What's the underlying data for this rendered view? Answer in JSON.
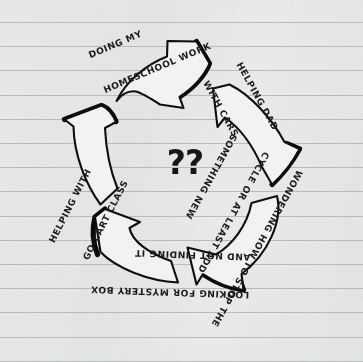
{
  "page": {
    "medium": "lined notebook paper",
    "paper_color": "#e9e9e9",
    "rule_line_color": "#b9bcc0",
    "ink_color": "#141414"
  },
  "diagram": {
    "type": "cycle",
    "direction": "clockwise",
    "node_count": 5,
    "center_label": "??",
    "nodes": [
      {
        "id": "doing-homeschool-work",
        "position": "top",
        "lines": [
          "DOING MY",
          "HOMESCHOOL WORK"
        ],
        "rotation_deg": -23
      },
      {
        "id": "helping-dad-with-cars",
        "position": "upper-right",
        "lines": [
          "HELPING DAD",
          "WITH CARS"
        ],
        "rotation_deg": 61
      },
      {
        "id": "wondering-how-to-stop-the-cycle",
        "position": "lower-right",
        "lines": [
          "WONDERING HOW TO STOP THE",
          "CYCLE OR AT LEAST ADD",
          "SOMETHING NEW"
        ],
        "rotation_deg": 119
      },
      {
        "id": "looking-for-mystery-box",
        "position": "bottom",
        "lines": [
          "LOOKING FOR MYSTERY BOX",
          "AND NOT FINDING IT"
        ],
        "rotation_deg": 182
      },
      {
        "id": "helping-with-go-cart-class",
        "position": "left",
        "lines": [
          "HELPING WITH",
          "GO-CART CLASS"
        ],
        "rotation_deg": -63
      }
    ],
    "arrows": [
      {
        "id": "arrow-top",
        "points_to": "upper-right"
      },
      {
        "id": "arrow-upper-right",
        "points_to": "lower-right"
      },
      {
        "id": "arrow-lower-right",
        "points_to": "bottom"
      },
      {
        "id": "arrow-bottom-left",
        "points_to": "left"
      },
      {
        "id": "arrow-left",
        "points_to": "top"
      }
    ]
  }
}
